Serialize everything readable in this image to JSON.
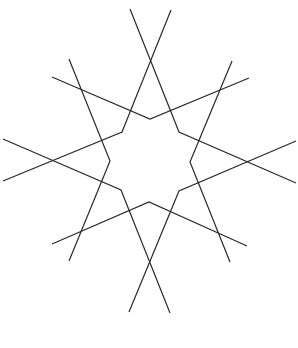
{
  "figure": {
    "type": "geometric-star-pattern",
    "stroke_color": "#2a2a2a",
    "background_color": "#ffffff",
    "polylines": [
      {
        "name": "line-a",
        "points": "130,9 179,132 296,183"
      },
      {
        "name": "line-b",
        "points": "171,10 122,132 3,181"
      },
      {
        "name": "line-c",
        "points": "69,59 110,161 69,261"
      },
      {
        "name": "line-d",
        "points": "232,61 190,162 230,262"
      },
      {
        "name": "line-e",
        "points": "52,77 150,119 249,78"
      },
      {
        "name": "line-f",
        "points": "52,244 149,202 247,246"
      },
      {
        "name": "line-g",
        "points": "3,139 121,190 170,313"
      },
      {
        "name": "line-h",
        "points": "296,141 179,191 129,312"
      }
    ],
    "baseline": {
      "x1": 20,
      "y1": 346.5,
      "x2": 298,
      "y2": 346.5,
      "color_start": "#3a3a3a",
      "color_end": "#e6e6e6"
    }
  }
}
